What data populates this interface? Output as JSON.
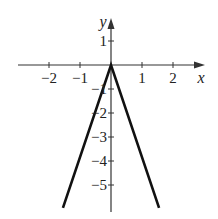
{
  "chart_data": {
    "type": "line",
    "title": "",
    "xlabel": "x",
    "ylabel": "y",
    "xlim": [
      -2.9,
      2.9
    ],
    "ylim": [
      -6,
      1.9
    ],
    "x_ticks": [
      -2,
      -1,
      1,
      2
    ],
    "x_tick_labels": [
      "−2",
      "−1",
      "1",
      "2"
    ],
    "y_ticks": [
      1,
      -1,
      -2,
      -3,
      -4,
      -5
    ],
    "y_tick_labels": [
      "1",
      "−1",
      "−2",
      "−3",
      "−4",
      "−5"
    ],
    "grid": false,
    "series": [
      {
        "name": "y = -4|x|",
        "x": [
          -1.5,
          0,
          1.5
        ],
        "y": [
          -6,
          0,
          6
        ]
      }
    ],
    "function": "y = -4|x|"
  }
}
